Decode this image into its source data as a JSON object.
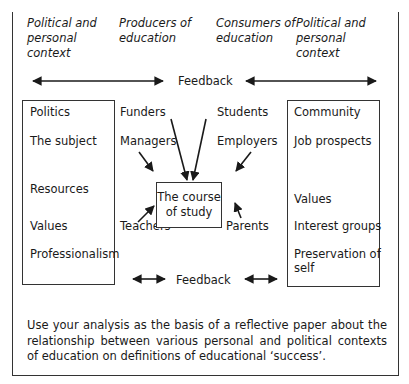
{
  "headers": {
    "left_context": "Political and\npersonal\ncontext",
    "producers": "Producers of\neducation",
    "consumers": "Consumers of\neducation",
    "right_context": "Political and\npersonal\ncontext"
  },
  "feedback": {
    "top_label": "Feedback",
    "bottom_label": "Feedback"
  },
  "left_box": {
    "items": [
      "Politics",
      "The subject",
      "Resources",
      "Values",
      "Professionalism"
    ]
  },
  "producers": {
    "items": [
      "Funders",
      "Managers",
      "Teachers"
    ]
  },
  "consumers": {
    "items": [
      "Students",
      "Employers",
      "Parents"
    ]
  },
  "center": {
    "label": "The course\nof study"
  },
  "right_box": {
    "items": [
      "Community",
      "Job prospects",
      "Values",
      "Interest groups",
      "Preservation of\nself"
    ]
  },
  "footer": {
    "instruction": "Use your analysis as the basis of a reflective paper about the relationship between various personal and political contexts of education on definitions of educational ‘success’."
  },
  "colors": {
    "line": "#1a1a1a",
    "frame": "#333333",
    "background": "#ffffff"
  }
}
